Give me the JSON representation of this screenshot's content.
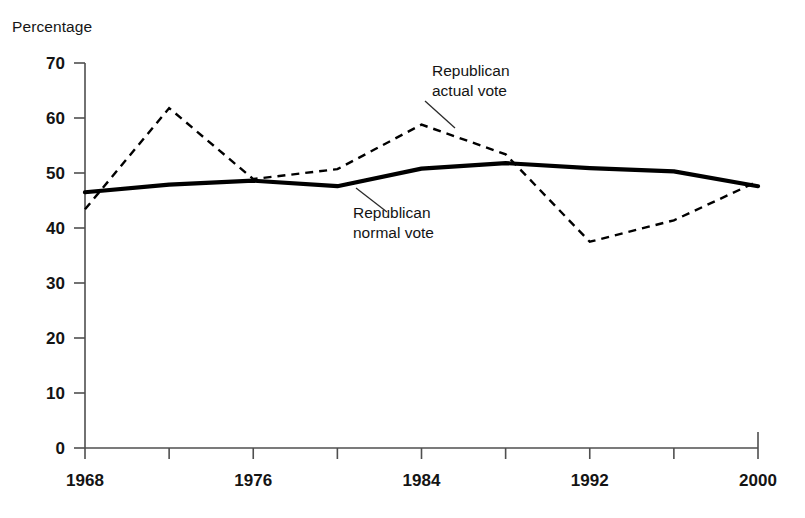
{
  "figure": {
    "axis_title": "Percentage",
    "background": "#ffffff",
    "ink_color": "#000000"
  },
  "annotations": {
    "actual": {
      "line1": "Republican",
      "line2": "actual vote"
    },
    "normal": {
      "line1": "Republican",
      "line2": "normal vote"
    }
  },
  "chart_data": {
    "type": "line",
    "title": "",
    "subtitle": "",
    "xlabel": "",
    "ylabel": "Percentage",
    "xlim": [
      1968,
      2000
    ],
    "ylim": [
      0,
      70
    ],
    "grid": false,
    "legend": "inline annotations",
    "x": [
      1968,
      1972,
      1976,
      1980,
      1984,
      1988,
      1992,
      1996,
      2000
    ],
    "xticks_major": [
      1968,
      1976,
      1984,
      1992,
      2000
    ],
    "xticks_minor": [
      1972,
      1980,
      1988,
      1996
    ],
    "xtick_labels": [
      "1968",
      "1976",
      "1984",
      "1992",
      "2000"
    ],
    "yticks": [
      0,
      10,
      20,
      30,
      40,
      50,
      60,
      70
    ],
    "ytick_labels": [
      "0",
      "10",
      "20",
      "30",
      "40",
      "50",
      "60",
      "70"
    ],
    "series": [
      {
        "name": "Republican actual vote",
        "style": "dashed",
        "values": [
          43.4,
          61.8,
          48.9,
          50.7,
          58.8,
          53.4,
          37.5,
          41.4,
          48.5
        ]
      },
      {
        "name": "Republican normal vote",
        "style": "solid",
        "values": [
          46.5,
          47.9,
          48.6,
          47.6,
          50.8,
          51.8,
          50.9,
          50.3,
          47.6
        ]
      }
    ]
  }
}
